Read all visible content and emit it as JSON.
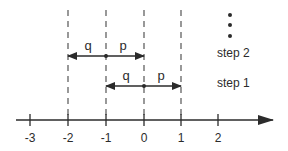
{
  "diagram": {
    "type": "number-line-random-walk",
    "colors": {
      "line": "#2b2b2b",
      "dashed": "#555555",
      "background": "#ffffff"
    },
    "axis": {
      "ticks": [
        {
          "value": -3,
          "label": "-3",
          "x": 30
        },
        {
          "value": -2,
          "label": "-2",
          "x": 68
        },
        {
          "value": -1,
          "label": "-1",
          "x": 106
        },
        {
          "value": 0,
          "label": "0",
          "x": 144
        },
        {
          "value": 1,
          "label": "1",
          "x": 181
        },
        {
          "value": 2,
          "label": "2",
          "x": 218
        }
      ]
    },
    "dashed_guides_at": [
      -2,
      -1,
      0,
      1
    ],
    "steps": [
      {
        "name": "step 1",
        "label": "step 1",
        "center": 0,
        "left_label": "q",
        "right_label": "p",
        "left_end": -1,
        "right_end": 1
      },
      {
        "name": "step 2",
        "label": "step 2",
        "center": -1,
        "left_label": "q",
        "right_label": "p",
        "left_end": -2,
        "right_end": 0
      }
    ],
    "continuation": {
      "symbol": "vertical-ellipsis",
      "dots": 3
    }
  }
}
